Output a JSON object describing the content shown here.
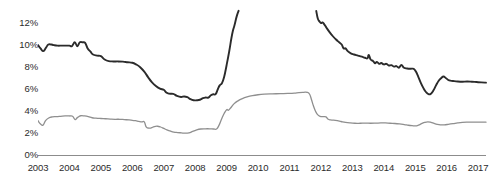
{
  "chart_data": {
    "type": "line",
    "title": "",
    "subtitle": "",
    "xlabel": "",
    "ylabel": "",
    "xlim": [
      2003,
      2017.25
    ],
    "ylim": [
      0,
      13
    ],
    "grid": false,
    "legend": "none",
    "y_tick_labels": [
      "12%",
      "10%",
      "8%",
      "6%",
      "4%",
      "2%",
      "0%"
    ],
    "y_tick_values": [
      12,
      10,
      8,
      6,
      4,
      2,
      0
    ],
    "x_tick_labels": [
      "2003",
      "2004",
      "2005",
      "2006",
      "2007",
      "2008",
      "2009",
      "2010",
      "2011",
      "2012",
      "2013",
      "2014",
      "2015",
      "2016",
      "2017"
    ],
    "x_tick_values": [
      2003,
      2004,
      2005,
      2006,
      2007,
      2008,
      2009,
      2010,
      2011,
      2012,
      2013,
      2014,
      2015,
      2016,
      2017
    ],
    "axis_color": "#8c8c8c",
    "note": "Dark series is clipped by the top of the plot area between 2009.3 and 2011.9",
    "series": [
      {
        "name": "dark-series",
        "color": "#2b2b2b",
        "width": 1.9,
        "points": [
          [
            2003.0,
            10.0
          ],
          [
            2003.08,
            9.7
          ],
          [
            2003.17,
            9.45
          ],
          [
            2003.25,
            9.75
          ],
          [
            2003.33,
            10.05
          ],
          [
            2003.42,
            10.05
          ],
          [
            2003.5,
            10.0
          ],
          [
            2003.62,
            9.95
          ],
          [
            2003.75,
            9.95
          ],
          [
            2003.88,
            9.95
          ],
          [
            2004.0,
            9.95
          ],
          [
            2004.08,
            9.9
          ],
          [
            2004.17,
            10.25
          ],
          [
            2004.25,
            9.9
          ],
          [
            2004.33,
            10.25
          ],
          [
            2004.42,
            10.25
          ],
          [
            2004.5,
            10.2
          ],
          [
            2004.58,
            9.7
          ],
          [
            2004.67,
            9.4
          ],
          [
            2004.75,
            9.15
          ],
          [
            2004.88,
            9.05
          ],
          [
            2005.0,
            9.0
          ],
          [
            2005.12,
            8.7
          ],
          [
            2005.25,
            8.55
          ],
          [
            2005.4,
            8.52
          ],
          [
            2005.55,
            8.52
          ],
          [
            2005.7,
            8.5
          ],
          [
            2005.85,
            8.45
          ],
          [
            2006.0,
            8.4
          ],
          [
            2006.12,
            8.25
          ],
          [
            2006.25,
            8.0
          ],
          [
            2006.38,
            7.6
          ],
          [
            2006.5,
            7.1
          ],
          [
            2006.62,
            6.65
          ],
          [
            2006.75,
            6.3
          ],
          [
            2006.88,
            6.05
          ],
          [
            2007.0,
            5.95
          ],
          [
            2007.08,
            5.7
          ],
          [
            2007.17,
            5.6
          ],
          [
            2007.3,
            5.58
          ],
          [
            2007.42,
            5.4
          ],
          [
            2007.55,
            5.3
          ],
          [
            2007.65,
            5.35
          ],
          [
            2007.75,
            5.28
          ],
          [
            2007.85,
            5.1
          ],
          [
            2007.95,
            5.0
          ],
          [
            2008.05,
            5.0
          ],
          [
            2008.15,
            5.05
          ],
          [
            2008.25,
            5.2
          ],
          [
            2008.33,
            5.25
          ],
          [
            2008.42,
            5.25
          ],
          [
            2008.5,
            5.45
          ],
          [
            2008.58,
            5.55
          ],
          [
            2008.65,
            5.55
          ],
          [
            2008.72,
            6.0
          ],
          [
            2008.78,
            6.35
          ],
          [
            2008.85,
            6.55
          ],
          [
            2008.92,
            7.1
          ],
          [
            2009.0,
            8.2
          ],
          [
            2009.08,
            9.4
          ],
          [
            2009.15,
            10.6
          ],
          [
            2009.2,
            11.3
          ],
          [
            2009.25,
            11.8
          ],
          [
            2009.32,
            12.6
          ],
          [
            2009.38,
            13.1
          ],
          [
            2011.85,
            13.1
          ],
          [
            2011.9,
            12.4
          ],
          [
            2011.95,
            12.15
          ],
          [
            2012.0,
            12.0
          ],
          [
            2012.05,
            12.05
          ],
          [
            2012.1,
            11.9
          ],
          [
            2012.18,
            11.55
          ],
          [
            2012.28,
            11.15
          ],
          [
            2012.38,
            10.8
          ],
          [
            2012.48,
            10.5
          ],
          [
            2012.58,
            10.25
          ],
          [
            2012.66,
            10.05
          ],
          [
            2012.72,
            9.7
          ],
          [
            2012.78,
            9.7
          ],
          [
            2012.85,
            9.45
          ],
          [
            2012.95,
            9.25
          ],
          [
            2013.05,
            9.15
          ],
          [
            2013.18,
            9.05
          ],
          [
            2013.3,
            8.95
          ],
          [
            2013.4,
            8.85
          ],
          [
            2013.48,
            8.8
          ],
          [
            2013.52,
            9.1
          ],
          [
            2013.58,
            8.7
          ],
          [
            2013.66,
            8.55
          ],
          [
            2013.72,
            8.35
          ],
          [
            2013.78,
            8.48
          ],
          [
            2013.85,
            8.3
          ],
          [
            2013.92,
            8.38
          ],
          [
            2014.0,
            8.25
          ],
          [
            2014.08,
            8.3
          ],
          [
            2014.16,
            8.15
          ],
          [
            2014.24,
            8.18
          ],
          [
            2014.32,
            8.05
          ],
          [
            2014.4,
            8.1
          ],
          [
            2014.48,
            7.95
          ],
          [
            2014.56,
            8.2
          ],
          [
            2014.64,
            7.95
          ],
          [
            2014.74,
            7.88
          ],
          [
            2014.85,
            7.85
          ],
          [
            2014.95,
            7.85
          ],
          [
            2015.02,
            7.6
          ],
          [
            2015.1,
            7.1
          ],
          [
            2015.18,
            6.55
          ],
          [
            2015.26,
            6.1
          ],
          [
            2015.34,
            5.75
          ],
          [
            2015.42,
            5.55
          ],
          [
            2015.5,
            5.6
          ],
          [
            2015.58,
            5.9
          ],
          [
            2015.66,
            6.35
          ],
          [
            2015.74,
            6.75
          ],
          [
            2015.82,
            7.0
          ],
          [
            2015.9,
            7.15
          ],
          [
            2015.98,
            7.0
          ],
          [
            2016.08,
            6.8
          ],
          [
            2016.2,
            6.75
          ],
          [
            2016.35,
            6.7
          ],
          [
            2016.5,
            6.68
          ],
          [
            2016.65,
            6.7
          ],
          [
            2016.8,
            6.68
          ],
          [
            2016.95,
            6.65
          ],
          [
            2017.1,
            6.62
          ],
          [
            2017.25,
            6.6
          ]
        ]
      },
      {
        "name": "light-series",
        "color": "#8f8f8f",
        "width": 1.3,
        "points": [
          [
            2003.0,
            3.15
          ],
          [
            2003.08,
            2.85
          ],
          [
            2003.16,
            2.75
          ],
          [
            2003.24,
            3.15
          ],
          [
            2003.34,
            3.4
          ],
          [
            2003.46,
            3.5
          ],
          [
            2003.58,
            3.52
          ],
          [
            2003.72,
            3.55
          ],
          [
            2003.86,
            3.58
          ],
          [
            2004.0,
            3.58
          ],
          [
            2004.1,
            3.55
          ],
          [
            2004.18,
            3.25
          ],
          [
            2004.26,
            3.45
          ],
          [
            2004.36,
            3.6
          ],
          [
            2004.48,
            3.58
          ],
          [
            2004.6,
            3.52
          ],
          [
            2004.72,
            3.42
          ],
          [
            2004.84,
            3.38
          ],
          [
            2005.0,
            3.35
          ],
          [
            2005.15,
            3.33
          ],
          [
            2005.3,
            3.3
          ],
          [
            2005.45,
            3.28
          ],
          [
            2005.6,
            3.28
          ],
          [
            2005.75,
            3.25
          ],
          [
            2005.9,
            3.22
          ],
          [
            2006.0,
            3.18
          ],
          [
            2006.1,
            3.15
          ],
          [
            2006.2,
            3.1
          ],
          [
            2006.3,
            3.05
          ],
          [
            2006.38,
            3.05
          ],
          [
            2006.44,
            2.6
          ],
          [
            2006.52,
            2.48
          ],
          [
            2006.6,
            2.5
          ],
          [
            2006.7,
            2.62
          ],
          [
            2006.8,
            2.65
          ],
          [
            2006.9,
            2.58
          ],
          [
            2007.0,
            2.45
          ],
          [
            2007.1,
            2.32
          ],
          [
            2007.2,
            2.22
          ],
          [
            2007.32,
            2.12
          ],
          [
            2007.44,
            2.08
          ],
          [
            2007.56,
            2.05
          ],
          [
            2007.68,
            2.02
          ],
          [
            2007.8,
            2.05
          ],
          [
            2007.92,
            2.18
          ],
          [
            2008.05,
            2.32
          ],
          [
            2008.18,
            2.4
          ],
          [
            2008.32,
            2.42
          ],
          [
            2008.46,
            2.42
          ],
          [
            2008.58,
            2.4
          ],
          [
            2008.68,
            2.4
          ],
          [
            2008.76,
            2.75
          ],
          [
            2008.84,
            3.3
          ],
          [
            2008.92,
            3.8
          ],
          [
            2009.0,
            4.15
          ],
          [
            2009.06,
            4.1
          ],
          [
            2009.14,
            4.35
          ],
          [
            2009.24,
            4.7
          ],
          [
            2009.36,
            4.95
          ],
          [
            2009.5,
            5.15
          ],
          [
            2009.65,
            5.3
          ],
          [
            2009.82,
            5.42
          ],
          [
            2010.0,
            5.5
          ],
          [
            2010.2,
            5.55
          ],
          [
            2010.45,
            5.58
          ],
          [
            2010.7,
            5.6
          ],
          [
            2010.95,
            5.62
          ],
          [
            2011.15,
            5.65
          ],
          [
            2011.3,
            5.7
          ],
          [
            2011.45,
            5.72
          ],
          [
            2011.56,
            5.72
          ],
          [
            2011.64,
            5.55
          ],
          [
            2011.7,
            5.05
          ],
          [
            2011.76,
            4.5
          ],
          [
            2011.82,
            4.05
          ],
          [
            2011.88,
            3.75
          ],
          [
            2011.94,
            3.6
          ],
          [
            2012.0,
            3.52
          ],
          [
            2012.08,
            3.52
          ],
          [
            2012.16,
            3.5
          ],
          [
            2012.22,
            3.3
          ],
          [
            2012.3,
            3.22
          ],
          [
            2012.4,
            3.2
          ],
          [
            2012.52,
            3.15
          ],
          [
            2012.64,
            3.08
          ],
          [
            2012.78,
            3.0
          ],
          [
            2012.92,
            2.95
          ],
          [
            2013.08,
            2.92
          ],
          [
            2013.25,
            2.92
          ],
          [
            2013.42,
            2.93
          ],
          [
            2013.58,
            2.92
          ],
          [
            2013.74,
            2.93
          ],
          [
            2013.9,
            2.95
          ],
          [
            2014.05,
            2.95
          ],
          [
            2014.2,
            2.92
          ],
          [
            2014.35,
            2.9
          ],
          [
            2014.5,
            2.86
          ],
          [
            2014.65,
            2.8
          ],
          [
            2014.78,
            2.74
          ],
          [
            2014.9,
            2.7
          ],
          [
            2015.0,
            2.68
          ],
          [
            2015.1,
            2.75
          ],
          [
            2015.2,
            2.88
          ],
          [
            2015.3,
            3.0
          ],
          [
            2015.4,
            3.05
          ],
          [
            2015.5,
            3.0
          ],
          [
            2015.6,
            2.9
          ],
          [
            2015.7,
            2.82
          ],
          [
            2015.8,
            2.78
          ],
          [
            2015.92,
            2.78
          ],
          [
            2016.05,
            2.82
          ],
          [
            2016.2,
            2.88
          ],
          [
            2016.35,
            2.95
          ],
          [
            2016.5,
            3.0
          ],
          [
            2016.65,
            3.02
          ],
          [
            2016.82,
            3.02
          ],
          [
            2017.0,
            3.02
          ],
          [
            2017.25,
            3.02
          ]
        ]
      }
    ]
  }
}
